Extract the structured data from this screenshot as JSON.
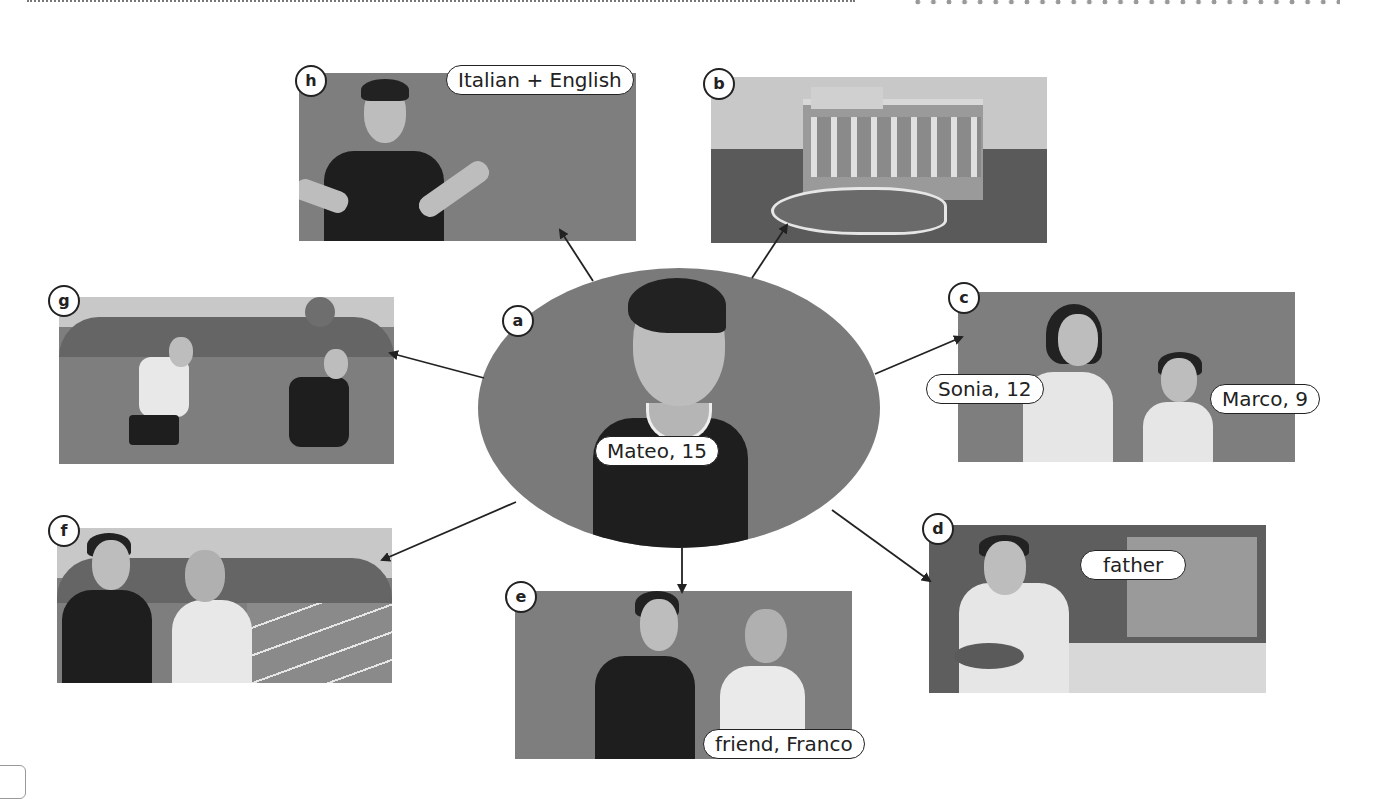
{
  "diagram": {
    "center": {
      "letter": "a",
      "name_label": "Mateo, 15"
    },
    "panels": [
      {
        "id": "h",
        "letter": "h",
        "labels": [
          "Italian + English"
        ],
        "description": "Mateo speaking, speech bubble"
      },
      {
        "id": "b",
        "letter": "b",
        "labels": [],
        "description": "Trevi Fountain building"
      },
      {
        "id": "c",
        "letter": "c",
        "labels": [
          "Sonia, 12",
          "Marco, 9"
        ],
        "description": "sister and brother"
      },
      {
        "id": "d",
        "letter": "d",
        "labels": [
          "father"
        ],
        "description": "fishmonger father at fish counter"
      },
      {
        "id": "e",
        "letter": "e",
        "labels": [
          "friend, Franco"
        ],
        "description": "Mateo with friend"
      },
      {
        "id": "f",
        "letter": "f",
        "labels": [],
        "description": "two boys at tennis court"
      },
      {
        "id": "g",
        "letter": "g",
        "labels": [],
        "description": "two boys playing football"
      }
    ]
  },
  "colors": {
    "panel_gray": "#7e7e7e",
    "sky_gray": "#c8c8c8",
    "shirt_dark": "#1e1e1e",
    "outline": "#222222"
  }
}
